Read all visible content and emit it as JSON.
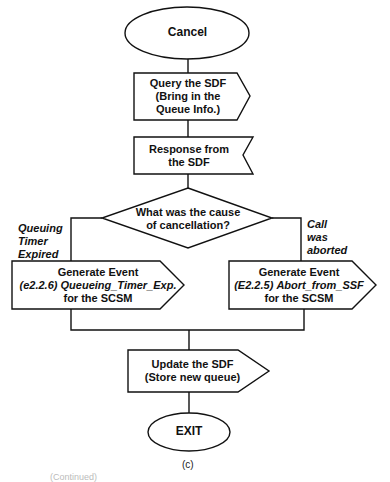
{
  "figure": {
    "caption": "(c)",
    "footer_fragment": "(Continued)"
  },
  "nodes": {
    "start": {
      "shape": "ellipse",
      "label": "Cancel"
    },
    "query": {
      "shape": "output-pentagon",
      "line1": "Query the SDF",
      "line2": "(Bring in the",
      "line3": "Queue Info.)"
    },
    "response": {
      "shape": "input-notch",
      "line1": "Response from",
      "line2": "the SDF"
    },
    "decision": {
      "shape": "diamond",
      "line1": "What was the cause",
      "line2": "of cancellation?"
    },
    "left_event": {
      "shape": "output-pentagon",
      "line1": "Generate Event",
      "code": "(e2.2.6)",
      "event": "Queueing_Timer_Exp.",
      "line3": "for the SCSM"
    },
    "right_event": {
      "shape": "output-pentagon",
      "line1": "Generate Event",
      "code": "(E2.2.5)",
      "event": "Abort_from_SSF",
      "line3": "for the SCSM"
    },
    "update": {
      "shape": "output-pentagon",
      "line1": "Update the SDF",
      "line2": "(Store new queue)"
    },
    "end": {
      "shape": "ellipse",
      "label": "EXIT"
    }
  },
  "branches": {
    "left": {
      "line1": "Queuing",
      "line2": "Timer",
      "line3": "Expired"
    },
    "right": {
      "line1": "Call",
      "line2": "was",
      "line3": "aborted"
    }
  },
  "edges": [
    [
      "start",
      "query"
    ],
    [
      "query",
      "response"
    ],
    [
      "response",
      "decision"
    ],
    [
      "decision",
      "left_event"
    ],
    [
      "decision",
      "right_event"
    ],
    [
      "left_event",
      "update"
    ],
    [
      "right_event",
      "update"
    ],
    [
      "update",
      "end"
    ]
  ],
  "colors": {
    "stroke": "#111111",
    "background": "#ffffff"
  }
}
